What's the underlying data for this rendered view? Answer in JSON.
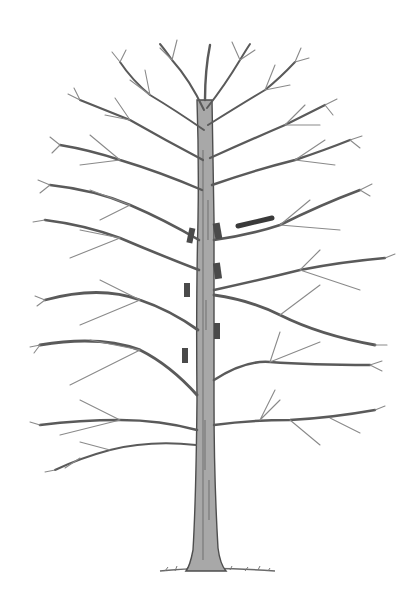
{
  "illustration": {
    "subject": "bare deciduous tree with pruning cut markers",
    "colors": {
      "background": "#ffffff",
      "branch": "#5a5a5a",
      "twig": "#8a8a8a",
      "trunk": "#9a9a9a",
      "marker": "#4a4a4a",
      "ground": "#6a6a6a"
    },
    "markers": [
      {
        "x": 188,
        "y": 228,
        "w": 6,
        "h": 15,
        "rotate": 12
      },
      {
        "x": 214,
        "y": 223,
        "w": 7,
        "h": 16,
        "rotate": -10
      },
      {
        "x": 184,
        "y": 283,
        "w": 6,
        "h": 14,
        "rotate": 0
      },
      {
        "x": 214,
        "y": 263,
        "w": 7,
        "h": 16,
        "rotate": -8
      },
      {
        "x": 214,
        "y": 323,
        "w": 6,
        "h": 16,
        "rotate": 0
      },
      {
        "x": 182,
        "y": 348,
        "w": 6,
        "h": 15,
        "rotate": 0
      }
    ]
  }
}
